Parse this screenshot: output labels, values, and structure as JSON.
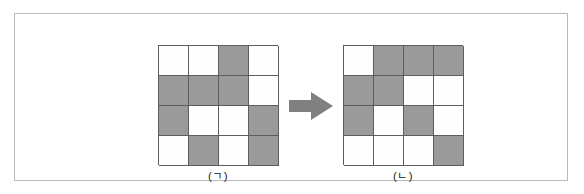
{
  "figure": {
    "type": "grid-transformation-diagram",
    "frame": {
      "border_color": "#b9b9bb",
      "background": "#ffffff"
    },
    "palette": {
      "filled": "#9a9a9a",
      "empty": "#fefefe",
      "cell_border": "#5d5d5d",
      "arrow": "#808080",
      "text": "#232323"
    },
    "panels": [
      {
        "id": "panel-a",
        "label": "(ㄱ)",
        "rows": 4,
        "cols": 4,
        "cells": [
          [
            "white",
            "white",
            "gray",
            "white"
          ],
          [
            "gray",
            "gray",
            "gray",
            "white"
          ],
          [
            "gray",
            "white",
            "white",
            "gray"
          ],
          [
            "white",
            "gray",
            "white",
            "gray"
          ]
        ]
      },
      {
        "id": "panel-b",
        "label": "(ㄴ)",
        "rows": 4,
        "cols": 4,
        "cells": [
          [
            "white",
            "gray",
            "gray",
            "gray"
          ],
          [
            "gray",
            "gray",
            "white",
            "white"
          ],
          [
            "gray",
            "white",
            "gray",
            "white"
          ],
          [
            "white",
            "white",
            "white",
            "gray"
          ]
        ]
      }
    ],
    "arrow": {
      "direction": "right",
      "icon": "arrow-right-icon",
      "color": "#808080"
    }
  }
}
